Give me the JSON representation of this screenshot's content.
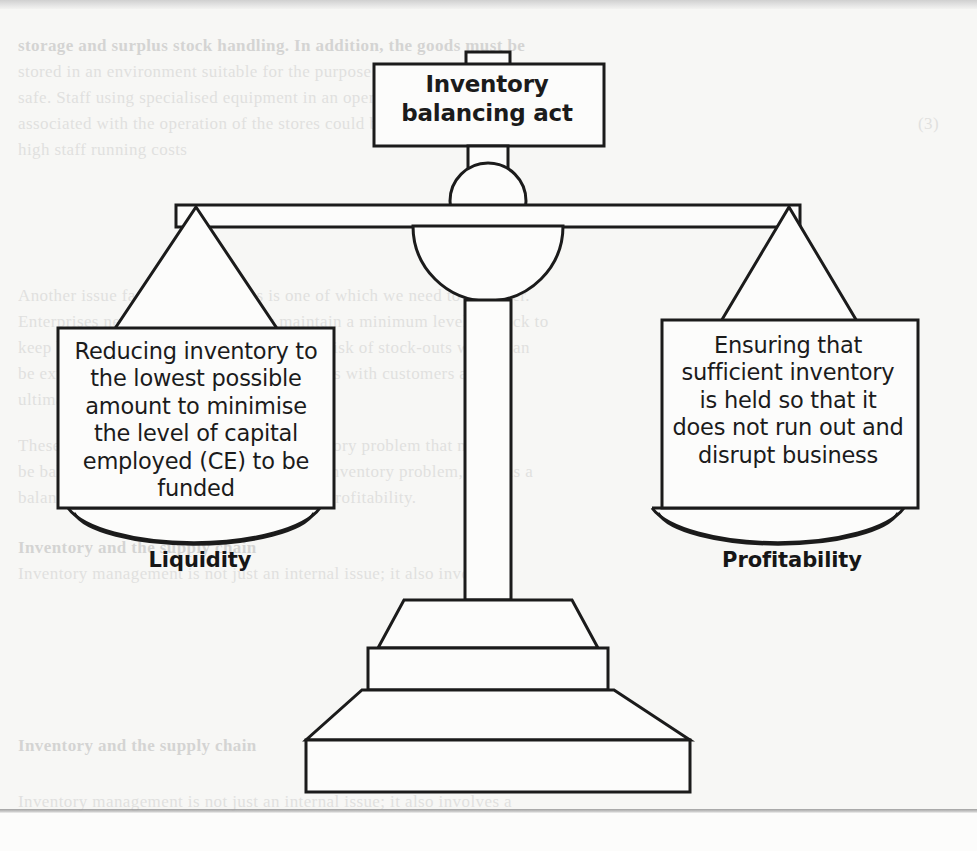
{
  "figure": {
    "title": "Inventory balancing act",
    "title_line1": "Inventory",
    "title_line2": "balancing act",
    "ink_color": "#1b1b1b",
    "paper_color": "#f7f7f5",
    "fill_color": "#fcfcfb"
  },
  "left_side": {
    "box_text": "Reducing inventory to the lowest possible amount to minimise the level of capital employed (CE) to be funded",
    "lines": [
      "Reducing inventory to",
      "the lowest possible",
      "amount to minimise",
      "the level of capital",
      "employed (CE) to be",
      "funded"
    ],
    "pan_label": "Liquidity"
  },
  "right_side": {
    "box_text": "Ensuring that sufficient inventory is held so that it does not run out and disrupt business",
    "lines": [
      "Ensuring that",
      "sufficient inventory",
      "is held so that it",
      "does not run out and",
      "disrupt business"
    ],
    "pan_label": "Profitability"
  },
  "background_showthrough": {
    "note": "Faint mirrored text bleeding through from the reverse of the scanned page",
    "lines": [
      "storage and surplus stock handling. In addition, the goods must be",
      "stored in an environment suitable for the purpose of keeping such goods",
      "safe. Staff using specialised equipment in an operating store",
      "associated with the operation of the stores could be paid to attend",
      "(3)",
      "high staff running costs",
      "",
      "Another issue faced by businesses is one of which we need to consider.",
      "Enterprises need to ensure that they maintain a minimum level of stock to",
      "keep businesses running so as to avoid the risk of stock-outs which can",
      "be extremely damaging to sales relationships with customers and",
      "ultimately the profit.",
      "",
      "These are the two core aspects of the inventory problem that must",
      "be balanced against each other. This is the inventory problem, there is a",
      "balance to be struck between liquidity and profitability.",
      "",
      "Inventory and the supply chain",
      "Inventory management is not just an internal issue; it also involves a"
    ]
  }
}
